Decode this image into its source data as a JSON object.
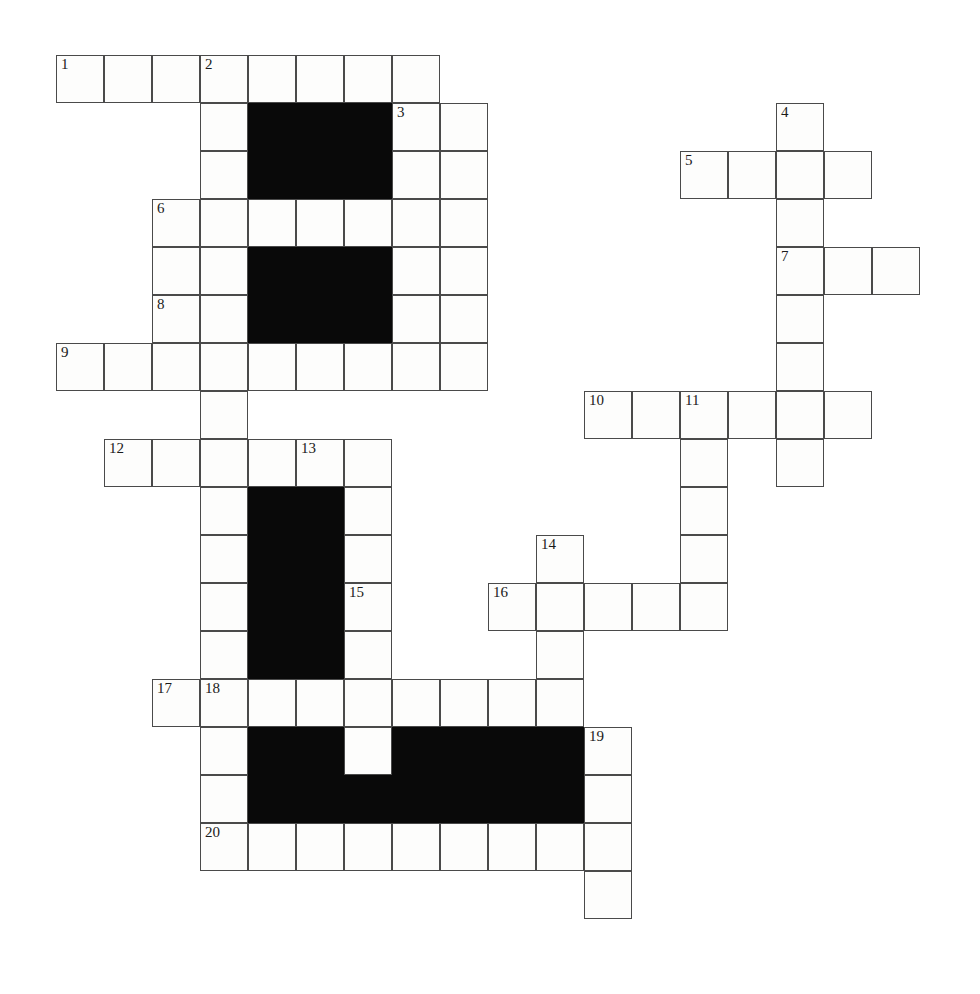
{
  "puzzle": {
    "kind": "crossword-grid",
    "title": "",
    "width_px": 980,
    "height_px": 994,
    "cell_size_px": 48,
    "origin_x_px": 56,
    "origin_y_px": 55,
    "columns": 18,
    "rows": 20,
    "colors": {
      "page_background": "#ffffff",
      "cell_fill": "#fdfdfc",
      "cell_border": "#4a4a4a",
      "block_fill": "#090909",
      "number_text": "#1a1a1a"
    },
    "clue_numbers": [
      1,
      2,
      3,
      4,
      5,
      6,
      7,
      8,
      9,
      10,
      11,
      12,
      13,
      14,
      15,
      16,
      17,
      18,
      19,
      20
    ],
    "numbered_cells": [
      {
        "number": "1",
        "col": 0,
        "row": 0
      },
      {
        "number": "2",
        "col": 3,
        "row": 0
      },
      {
        "number": "3",
        "col": 7,
        "row": 1
      },
      {
        "number": "4",
        "col": 15,
        "row": 1
      },
      {
        "number": "5",
        "col": 13,
        "row": 2
      },
      {
        "number": "6",
        "col": 2,
        "row": 3
      },
      {
        "number": "7",
        "col": 15,
        "row": 4
      },
      {
        "number": "8",
        "col": 2,
        "row": 5
      },
      {
        "number": "9",
        "col": 0,
        "row": 6
      },
      {
        "number": "10",
        "col": 11,
        "row": 7
      },
      {
        "number": "11",
        "col": 13,
        "row": 7
      },
      {
        "number": "12",
        "col": 1,
        "row": 8
      },
      {
        "number": "13",
        "col": 5,
        "row": 8
      },
      {
        "number": "14",
        "col": 10,
        "row": 10
      },
      {
        "number": "15",
        "col": 6,
        "row": 11
      },
      {
        "number": "16",
        "col": 9,
        "row": 11
      },
      {
        "number": "17",
        "col": 2,
        "row": 13
      },
      {
        "number": "18",
        "col": 3,
        "row": 13
      },
      {
        "number": "19",
        "col": 11,
        "row": 14
      },
      {
        "number": "20",
        "col": 3,
        "row": 16
      }
    ],
    "open_cells": [
      {
        "col": 0,
        "row": 0
      },
      {
        "col": 1,
        "row": 0
      },
      {
        "col": 2,
        "row": 0
      },
      {
        "col": 3,
        "row": 0
      },
      {
        "col": 4,
        "row": 0
      },
      {
        "col": 5,
        "row": 0
      },
      {
        "col": 6,
        "row": 0
      },
      {
        "col": 7,
        "row": 0
      },
      {
        "col": 3,
        "row": 1
      },
      {
        "col": 7,
        "row": 1
      },
      {
        "col": 8,
        "row": 1
      },
      {
        "col": 15,
        "row": 1
      },
      {
        "col": 3,
        "row": 2
      },
      {
        "col": 7,
        "row": 2
      },
      {
        "col": 8,
        "row": 2
      },
      {
        "col": 13,
        "row": 2
      },
      {
        "col": 14,
        "row": 2
      },
      {
        "col": 15,
        "row": 2
      },
      {
        "col": 16,
        "row": 2
      },
      {
        "col": 2,
        "row": 3
      },
      {
        "col": 3,
        "row": 3
      },
      {
        "col": 4,
        "row": 3
      },
      {
        "col": 5,
        "row": 3
      },
      {
        "col": 6,
        "row": 3
      },
      {
        "col": 7,
        "row": 3
      },
      {
        "col": 8,
        "row": 3
      },
      {
        "col": 15,
        "row": 3
      },
      {
        "col": 2,
        "row": 4
      },
      {
        "col": 3,
        "row": 4
      },
      {
        "col": 7,
        "row": 4
      },
      {
        "col": 8,
        "row": 4
      },
      {
        "col": 15,
        "row": 4
      },
      {
        "col": 16,
        "row": 4
      },
      {
        "col": 17,
        "row": 4
      },
      {
        "col": 2,
        "row": 5
      },
      {
        "col": 3,
        "row": 5
      },
      {
        "col": 7,
        "row": 5
      },
      {
        "col": 8,
        "row": 5
      },
      {
        "col": 15,
        "row": 5
      },
      {
        "col": 0,
        "row": 6
      },
      {
        "col": 1,
        "row": 6
      },
      {
        "col": 2,
        "row": 6
      },
      {
        "col": 3,
        "row": 6
      },
      {
        "col": 4,
        "row": 6
      },
      {
        "col": 5,
        "row": 6
      },
      {
        "col": 6,
        "row": 6
      },
      {
        "col": 7,
        "row": 6
      },
      {
        "col": 8,
        "row": 6
      },
      {
        "col": 15,
        "row": 6
      },
      {
        "col": 3,
        "row": 7
      },
      {
        "col": 11,
        "row": 7
      },
      {
        "col": 12,
        "row": 7
      },
      {
        "col": 13,
        "row": 7
      },
      {
        "col": 14,
        "row": 7
      },
      {
        "col": 15,
        "row": 7
      },
      {
        "col": 16,
        "row": 7
      },
      {
        "col": 1,
        "row": 8
      },
      {
        "col": 2,
        "row": 8
      },
      {
        "col": 3,
        "row": 8
      },
      {
        "col": 4,
        "row": 8
      },
      {
        "col": 5,
        "row": 8
      },
      {
        "col": 6,
        "row": 8
      },
      {
        "col": 13,
        "row": 8
      },
      {
        "col": 15,
        "row": 8
      },
      {
        "col": 3,
        "row": 9
      },
      {
        "col": 6,
        "row": 9
      },
      {
        "col": 13,
        "row": 9
      },
      {
        "col": 3,
        "row": 10
      },
      {
        "col": 6,
        "row": 10
      },
      {
        "col": 10,
        "row": 10
      },
      {
        "col": 13,
        "row": 10
      },
      {
        "col": 3,
        "row": 11
      },
      {
        "col": 6,
        "row": 11
      },
      {
        "col": 9,
        "row": 11
      },
      {
        "col": 10,
        "row": 11
      },
      {
        "col": 11,
        "row": 11
      },
      {
        "col": 12,
        "row": 11
      },
      {
        "col": 13,
        "row": 11
      },
      {
        "col": 3,
        "row": 12
      },
      {
        "col": 6,
        "row": 12
      },
      {
        "col": 10,
        "row": 12
      },
      {
        "col": 2,
        "row": 13
      },
      {
        "col": 3,
        "row": 13
      },
      {
        "col": 4,
        "row": 13
      },
      {
        "col": 5,
        "row": 13
      },
      {
        "col": 6,
        "row": 13
      },
      {
        "col": 7,
        "row": 13
      },
      {
        "col": 8,
        "row": 13
      },
      {
        "col": 9,
        "row": 13
      },
      {
        "col": 10,
        "row": 13
      },
      {
        "col": 3,
        "row": 14
      },
      {
        "col": 6,
        "row": 14
      },
      {
        "col": 11,
        "row": 14
      },
      {
        "col": 3,
        "row": 15
      },
      {
        "col": 11,
        "row": 15
      },
      {
        "col": 3,
        "row": 16
      },
      {
        "col": 4,
        "row": 16
      },
      {
        "col": 5,
        "row": 16
      },
      {
        "col": 6,
        "row": 16
      },
      {
        "col": 7,
        "row": 16
      },
      {
        "col": 8,
        "row": 16
      },
      {
        "col": 9,
        "row": 16
      },
      {
        "col": 10,
        "row": 16
      },
      {
        "col": 11,
        "row": 16
      },
      {
        "col": 11,
        "row": 17
      }
    ],
    "block_cells": [
      {
        "col": 4,
        "row": 1
      },
      {
        "col": 5,
        "row": 1
      },
      {
        "col": 6,
        "row": 1
      },
      {
        "col": 4,
        "row": 2
      },
      {
        "col": 5,
        "row": 2
      },
      {
        "col": 6,
        "row": 2
      },
      {
        "col": 4,
        "row": 4
      },
      {
        "col": 5,
        "row": 4
      },
      {
        "col": 6,
        "row": 4
      },
      {
        "col": 4,
        "row": 5
      },
      {
        "col": 5,
        "row": 5
      },
      {
        "col": 6,
        "row": 5
      },
      {
        "col": 3,
        "row": 5
      },
      {
        "col": 4,
        "row": 9
      },
      {
        "col": 5,
        "row": 9
      },
      {
        "col": 4,
        "row": 10
      },
      {
        "col": 5,
        "row": 10
      },
      {
        "col": 4,
        "row": 11
      },
      {
        "col": 5,
        "row": 11
      },
      {
        "col": 4,
        "row": 12
      },
      {
        "col": 5,
        "row": 12
      },
      {
        "col": 4,
        "row": 14
      },
      {
        "col": 5,
        "row": 14
      },
      {
        "col": 7,
        "row": 14
      },
      {
        "col": 8,
        "row": 14
      },
      {
        "col": 9,
        "row": 14
      },
      {
        "col": 10,
        "row": 14
      },
      {
        "col": 4,
        "row": 15
      },
      {
        "col": 5,
        "row": 15
      },
      {
        "col": 6,
        "row": 15
      },
      {
        "col": 7,
        "row": 15
      },
      {
        "col": 8,
        "row": 15
      },
      {
        "col": 9,
        "row": 15
      },
      {
        "col": 10,
        "row": 15
      }
    ]
  }
}
